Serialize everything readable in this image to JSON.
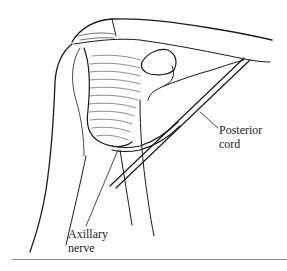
{
  "figure": {
    "labels": {
      "posterior_cord": [
        "Posterior",
        "cord"
      ],
      "axillary_nerve": [
        "Axillary",
        "nerve"
      ]
    }
  },
  "colors": {
    "ink": "#1a1a1a",
    "background": "#ffffff",
    "rule": "#888888"
  }
}
